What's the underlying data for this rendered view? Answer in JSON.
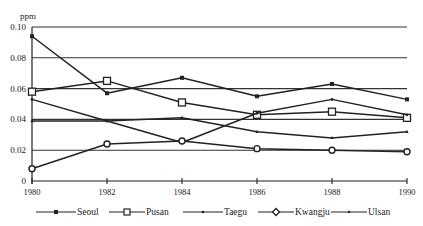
{
  "chart_data": {
    "type": "line",
    "title": "",
    "xlabel": "",
    "ylabel": "ppm",
    "x": [
      1980,
      1982,
      1984,
      1986,
      1988,
      1990
    ],
    "x_tick_labels": [
      "1980",
      "1982",
      "1984",
      "1986",
      "1988",
      "1990"
    ],
    "y_tick_labels": [
      "0",
      "0.02",
      "0.04",
      "0.06",
      "0.08",
      "0.10"
    ],
    "ylim": [
      0,
      0.1
    ],
    "grid": "horizontal",
    "legend_position": "bottom",
    "series": [
      {
        "name": "Seoul",
        "marker": "filled-square",
        "values": [
          0.094,
          0.057,
          0.067,
          0.055,
          0.063,
          0.053
        ]
      },
      {
        "name": "Pusan",
        "marker": "open-square",
        "values": [
          0.058,
          0.065,
          0.051,
          0.043,
          0.045,
          0.041
        ]
      },
      {
        "name": "Taegu",
        "marker": "small-dot",
        "values": [
          0.053,
          0.039,
          0.025,
          0.044,
          0.053,
          0.043
        ]
      },
      {
        "name": "Kwangju",
        "marker": "open-diamond",
        "values": [
          0.008,
          0.024,
          0.026,
          0.021,
          0.02,
          0.019
        ]
      },
      {
        "name": "Ulsan",
        "marker": "small-triangle",
        "values": [
          0.039,
          0.039,
          0.041,
          0.032,
          0.028,
          0.032
        ]
      }
    ]
  },
  "axis": {
    "y_unit": "ppm"
  },
  "legend": {
    "items": [
      {
        "label": "Seoul"
      },
      {
        "label": "Pusan"
      },
      {
        "label": "Taegu"
      },
      {
        "label": "Kwangju"
      },
      {
        "label": "Ulsan"
      }
    ]
  }
}
